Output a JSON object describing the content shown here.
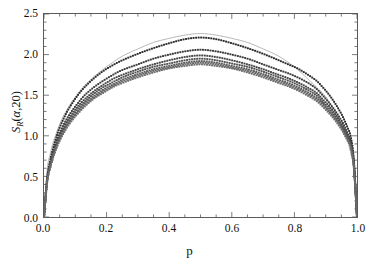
{
  "chart_data": {
    "type": "line",
    "title": "",
    "subtitle": "",
    "xlabel": "p",
    "ylabel_plain": "S_R(a,20)",
    "ylabel_parts": {
      "symbol": "S",
      "subscript": "R",
      "arg_open": "(",
      "arg_alpha": "α",
      "arg_comma": ",",
      "arg_n": "20",
      "arg_close": ")"
    },
    "xlim": [
      0.0,
      1.0
    ],
    "ylim": [
      0.0,
      2.5
    ],
    "xticks": [
      0.0,
      0.2,
      0.4,
      0.6,
      0.8,
      1.0
    ],
    "xtick_labels": [
      "0.0",
      "0.2",
      "0.4",
      "0.6",
      "0.8",
      "1.0"
    ],
    "yticks": [
      0.0,
      0.5,
      1.0,
      1.5,
      2.0,
      2.5
    ],
    "ytick_labels": [
      "0.0",
      "0.5",
      "1.0",
      "1.5",
      "2.0",
      "2.5"
    ],
    "x_minor_step": 0.05,
    "y_minor_step": 0.1,
    "grid": false,
    "legend": null,
    "legend_position": "none",
    "frame": "box-all-sides-inward-ticks",
    "marker": "small-filled-square-dot",
    "marker_size_px": 1.9,
    "background_color": "#ffffff",
    "frame_color": "#5a5a5a",
    "envelope": {
      "name": "envelope",
      "style": "thin-solid-line",
      "color": "#9a9a9a",
      "peak": 2.28,
      "x": [
        0.0,
        0.01,
        0.02,
        0.03,
        0.05,
        0.07,
        0.1,
        0.13,
        0.16,
        0.2,
        0.25,
        0.3,
        0.35,
        0.4,
        0.45,
        0.5,
        0.55,
        0.6,
        0.65,
        0.7,
        0.75,
        0.8,
        0.84,
        0.87,
        0.9,
        0.93,
        0.95,
        0.97,
        0.98,
        0.99,
        1.0
      ],
      "y": [
        0.0,
        0.58,
        0.78,
        0.93,
        1.14,
        1.3,
        1.48,
        1.62,
        1.73,
        1.85,
        1.98,
        2.07,
        2.15,
        2.2,
        2.24,
        2.26,
        2.24,
        2.2,
        2.15,
        2.07,
        1.98,
        1.85,
        1.71,
        1.6,
        1.48,
        1.3,
        1.14,
        0.93,
        0.78,
        0.58,
        0.0
      ]
    },
    "series": [
      {
        "name": "alpha-1",
        "color": "#2b2b2b",
        "peak": 2.22,
        "x": [
          0.0,
          0.01,
          0.02,
          0.03,
          0.04,
          0.05,
          0.07,
          0.09,
          0.11,
          0.13,
          0.16,
          0.19,
          0.22,
          0.25,
          0.3,
          0.35,
          0.4,
          0.45,
          0.5,
          0.55,
          0.6,
          0.65,
          0.7,
          0.75,
          0.78,
          0.81,
          0.84,
          0.87,
          0.89,
          0.91,
          0.93,
          0.95,
          0.96,
          0.97,
          0.98,
          0.99,
          1.0
        ],
        "y": [
          0.0,
          0.48,
          0.7,
          0.86,
          0.99,
          1.1,
          1.27,
          1.4,
          1.51,
          1.6,
          1.71,
          1.8,
          1.87,
          1.93,
          2.01,
          2.08,
          2.14,
          2.19,
          2.21,
          2.19,
          2.14,
          2.08,
          2.01,
          1.93,
          1.88,
          1.83,
          1.76,
          1.68,
          1.6,
          1.51,
          1.4,
          1.27,
          1.19,
          1.1,
          0.99,
          0.7,
          0.0
        ]
      },
      {
        "name": "alpha-2",
        "color": "#3a3a3a",
        "peak": 2.07,
        "x": [
          0.0,
          0.01,
          0.02,
          0.03,
          0.04,
          0.05,
          0.07,
          0.09,
          0.11,
          0.13,
          0.16,
          0.19,
          0.22,
          0.25,
          0.3,
          0.35,
          0.4,
          0.45,
          0.5,
          0.55,
          0.6,
          0.65,
          0.7,
          0.75,
          0.78,
          0.81,
          0.84,
          0.87,
          0.89,
          0.91,
          0.93,
          0.95,
          0.96,
          0.97,
          0.98,
          0.99,
          1.0
        ],
        "y": [
          0.0,
          0.46,
          0.66,
          0.81,
          0.93,
          1.03,
          1.19,
          1.31,
          1.41,
          1.5,
          1.6,
          1.68,
          1.75,
          1.81,
          1.88,
          1.95,
          2.0,
          2.04,
          2.06,
          2.04,
          2.0,
          1.95,
          1.88,
          1.81,
          1.77,
          1.72,
          1.66,
          1.58,
          1.5,
          1.41,
          1.31,
          1.19,
          1.12,
          1.03,
          0.93,
          0.66,
          0.0
        ]
      },
      {
        "name": "alpha-3",
        "color": "#454545",
        "peak": 2.0,
        "x": [
          0.0,
          0.01,
          0.02,
          0.03,
          0.04,
          0.05,
          0.07,
          0.09,
          0.11,
          0.13,
          0.16,
          0.19,
          0.22,
          0.25,
          0.3,
          0.35,
          0.4,
          0.45,
          0.5,
          0.55,
          0.6,
          0.65,
          0.7,
          0.75,
          0.78,
          0.81,
          0.84,
          0.87,
          0.89,
          0.91,
          0.93,
          0.95,
          0.96,
          0.97,
          0.98,
          0.99,
          1.0
        ],
        "y": [
          0.0,
          0.45,
          0.64,
          0.79,
          0.9,
          1.0,
          1.15,
          1.27,
          1.37,
          1.45,
          1.55,
          1.63,
          1.7,
          1.75,
          1.82,
          1.88,
          1.93,
          1.97,
          1.99,
          1.97,
          1.93,
          1.88,
          1.82,
          1.75,
          1.71,
          1.66,
          1.6,
          1.53,
          1.45,
          1.37,
          1.27,
          1.15,
          1.08,
          1.0,
          0.9,
          0.64,
          0.0
        ]
      },
      {
        "name": "alpha-4",
        "color": "#505050",
        "peak": 1.96,
        "x": [
          0.0,
          0.01,
          0.02,
          0.03,
          0.04,
          0.05,
          0.07,
          0.09,
          0.11,
          0.13,
          0.16,
          0.19,
          0.22,
          0.25,
          0.3,
          0.35,
          0.4,
          0.45,
          0.5,
          0.55,
          0.6,
          0.65,
          0.7,
          0.75,
          0.78,
          0.81,
          0.84,
          0.87,
          0.89,
          0.91,
          0.93,
          0.95,
          0.96,
          0.97,
          0.98,
          0.99,
          1.0
        ],
        "y": [
          0.0,
          0.44,
          0.63,
          0.77,
          0.88,
          0.98,
          1.13,
          1.24,
          1.34,
          1.42,
          1.52,
          1.6,
          1.66,
          1.72,
          1.79,
          1.85,
          1.89,
          1.93,
          1.95,
          1.93,
          1.89,
          1.85,
          1.79,
          1.72,
          1.68,
          1.63,
          1.57,
          1.5,
          1.42,
          1.34,
          1.24,
          1.13,
          1.06,
          0.98,
          0.88,
          0.63,
          0.0
        ]
      },
      {
        "name": "alpha-5",
        "color": "#5a5a5a",
        "peak": 1.93,
        "x": [
          0.0,
          0.01,
          0.02,
          0.03,
          0.04,
          0.05,
          0.07,
          0.09,
          0.11,
          0.13,
          0.16,
          0.19,
          0.22,
          0.25,
          0.3,
          0.35,
          0.4,
          0.45,
          0.5,
          0.55,
          0.6,
          0.65,
          0.7,
          0.75,
          0.78,
          0.81,
          0.84,
          0.87,
          0.89,
          0.91,
          0.93,
          0.95,
          0.96,
          0.97,
          0.98,
          0.99,
          1.0
        ],
        "y": [
          0.0,
          0.44,
          0.62,
          0.76,
          0.87,
          0.96,
          1.11,
          1.22,
          1.31,
          1.4,
          1.49,
          1.57,
          1.63,
          1.69,
          1.76,
          1.82,
          1.86,
          1.9,
          1.92,
          1.9,
          1.86,
          1.82,
          1.76,
          1.69,
          1.65,
          1.6,
          1.54,
          1.47,
          1.4,
          1.31,
          1.22,
          1.11,
          1.04,
          0.96,
          0.87,
          0.62,
          0.0
        ]
      },
      {
        "name": "alpha-6",
        "color": "#646464",
        "peak": 1.91,
        "x": [
          0.0,
          0.01,
          0.02,
          0.03,
          0.04,
          0.05,
          0.07,
          0.09,
          0.11,
          0.13,
          0.16,
          0.19,
          0.22,
          0.25,
          0.3,
          0.35,
          0.4,
          0.45,
          0.5,
          0.55,
          0.6,
          0.65,
          0.7,
          0.75,
          0.78,
          0.81,
          0.84,
          0.87,
          0.89,
          0.91,
          0.93,
          0.95,
          0.96,
          0.97,
          0.98,
          0.99,
          1.0
        ],
        "y": [
          0.0,
          0.43,
          0.61,
          0.75,
          0.86,
          0.95,
          1.1,
          1.21,
          1.3,
          1.38,
          1.47,
          1.55,
          1.61,
          1.67,
          1.74,
          1.8,
          1.84,
          1.88,
          1.9,
          1.88,
          1.84,
          1.8,
          1.74,
          1.67,
          1.63,
          1.58,
          1.52,
          1.45,
          1.38,
          1.3,
          1.21,
          1.1,
          1.03,
          0.95,
          0.86,
          0.61,
          0.0
        ]
      },
      {
        "name": "alpha-7",
        "color": "#6e6e6e",
        "peak": 1.89,
        "x": [
          0.0,
          0.01,
          0.02,
          0.03,
          0.04,
          0.05,
          0.07,
          0.09,
          0.11,
          0.13,
          0.16,
          0.19,
          0.22,
          0.25,
          0.3,
          0.35,
          0.4,
          0.45,
          0.5,
          0.55,
          0.6,
          0.65,
          0.7,
          0.75,
          0.78,
          0.81,
          0.84,
          0.87,
          0.89,
          0.91,
          0.93,
          0.95,
          0.96,
          0.97,
          0.98,
          0.99,
          1.0
        ],
        "y": [
          0.0,
          0.43,
          0.61,
          0.74,
          0.85,
          0.94,
          1.08,
          1.19,
          1.28,
          1.36,
          1.46,
          1.53,
          1.6,
          1.65,
          1.72,
          1.78,
          1.83,
          1.86,
          1.88,
          1.86,
          1.83,
          1.78,
          1.72,
          1.65,
          1.61,
          1.56,
          1.5,
          1.43,
          1.36,
          1.28,
          1.19,
          1.08,
          1.01,
          0.94,
          0.85,
          0.61,
          0.0
        ]
      }
    ]
  }
}
